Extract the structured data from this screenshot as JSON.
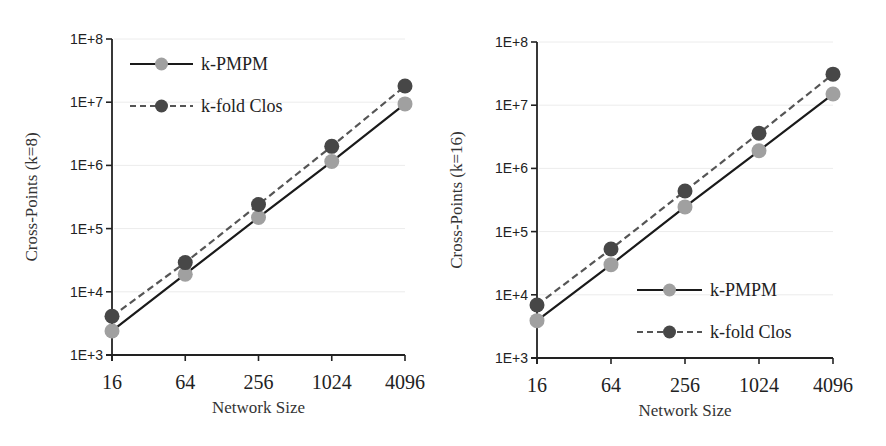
{
  "chart_data": [
    {
      "type": "line",
      "title": "",
      "xlabel": "Network Size",
      "ylabel": "Cross-Points (k=8)",
      "yscale": "log",
      "ylim": [
        1000,
        100000000
      ],
      "categories": [
        "16",
        "64",
        "256",
        "1024",
        "4096"
      ],
      "ytick_labels": [
        "1E+3",
        "1E+4",
        "1E+5",
        "1E+6",
        "1E+7",
        "1E+8"
      ],
      "grid": true,
      "legend_position": "top-left",
      "series": [
        {
          "name": "k-PMPM",
          "style": "solid",
          "color": "#a0a0a0",
          "values": [
            2400,
            19000,
            150000,
            1150000,
            9400000
          ]
        },
        {
          "name": "k-fold Clos",
          "style": "dashed",
          "color": "#474747",
          "values": [
            4100,
            29000,
            240000,
            2000000,
            18000000
          ]
        }
      ]
    },
    {
      "type": "line",
      "title": "",
      "xlabel": "Network Size",
      "ylabel": "Cross-Points (k=16)",
      "yscale": "log",
      "ylim": [
        1000,
        100000000
      ],
      "categories": [
        "16",
        "64",
        "256",
        "1024",
        "4096"
      ],
      "ytick_labels": [
        "1E+3",
        "1E+4",
        "1E+5",
        "1E+6",
        "1E+7",
        "1E+8"
      ],
      "grid": true,
      "legend_position": "bottom-right",
      "series": [
        {
          "name": "k-PMPM",
          "style": "solid",
          "color": "#a0a0a0",
          "values": [
            3900,
            30000,
            246000,
            1900000,
            15000000
          ]
        },
        {
          "name": "k-fold Clos",
          "style": "dashed",
          "color": "#474747",
          "values": [
            6900,
            53000,
            440000,
            3600000,
            31000000
          ]
        }
      ]
    }
  ]
}
